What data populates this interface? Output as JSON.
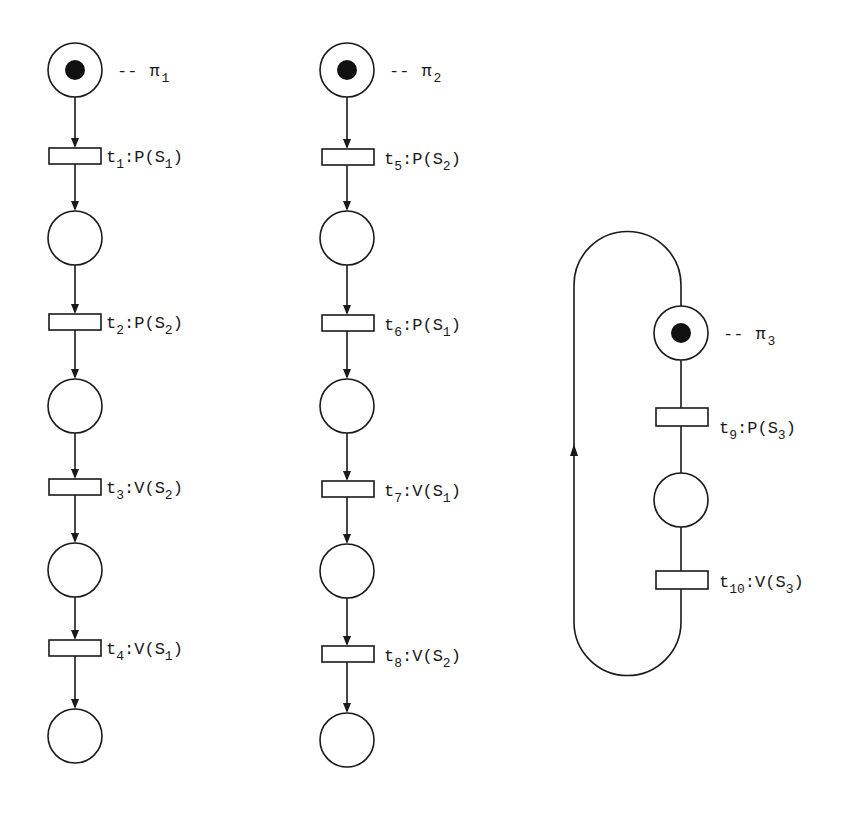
{
  "diagram": {
    "type": "petri-net",
    "processes": [
      {
        "id": "pi1",
        "label": {
          "name": "π",
          "sub": "1",
          "prefix": "--"
        },
        "places": [
          {
            "id": "p1_0",
            "token": true
          },
          {
            "id": "p1_1",
            "token": false
          },
          {
            "id": "p1_2",
            "token": false
          },
          {
            "id": "p1_3",
            "token": false
          },
          {
            "id": "p1_4",
            "token": false
          }
        ],
        "transitions": [
          {
            "t": "t",
            "tsub": "1",
            "op": "P",
            "sem": "S",
            "ssub": "1"
          },
          {
            "t": "t",
            "tsub": "2",
            "op": "P",
            "sem": "S",
            "ssub": "2"
          },
          {
            "t": "t",
            "tsub": "3",
            "op": "V",
            "sem": "S",
            "ssub": "2"
          },
          {
            "t": "t",
            "tsub": "4",
            "op": "V",
            "sem": "S",
            "ssub": "1"
          }
        ]
      },
      {
        "id": "pi2",
        "label": {
          "name": "π",
          "sub": "2",
          "prefix": "--"
        },
        "places": [
          {
            "id": "p2_0",
            "token": true
          },
          {
            "id": "p2_1",
            "token": false
          },
          {
            "id": "p2_2",
            "token": false
          },
          {
            "id": "p2_3",
            "token": false
          },
          {
            "id": "p2_4",
            "token": false
          }
        ],
        "transitions": [
          {
            "t": "t",
            "tsub": "5",
            "op": "P",
            "sem": "S",
            "ssub": "2"
          },
          {
            "t": "t",
            "tsub": "6",
            "op": "P",
            "sem": "S",
            "ssub": "1"
          },
          {
            "t": "t",
            "tsub": "7",
            "op": "V",
            "sem": "S",
            "ssub": "1"
          },
          {
            "t": "t",
            "tsub": "8",
            "op": "V",
            "sem": "S",
            "ssub": "2"
          }
        ]
      },
      {
        "id": "pi3",
        "label": {
          "name": "π",
          "sub": "3",
          "prefix": "--"
        },
        "cyclic": true,
        "places": [
          {
            "id": "p3_0",
            "token": true
          },
          {
            "id": "p3_1",
            "token": false
          }
        ],
        "transitions": [
          {
            "t": "t",
            "tsub": "9",
            "op": "P",
            "sem": "S",
            "ssub": "3"
          },
          {
            "t": "t",
            "tsub": "10",
            "op": "V",
            "sem": "S",
            "ssub": "3"
          }
        ]
      }
    ]
  }
}
